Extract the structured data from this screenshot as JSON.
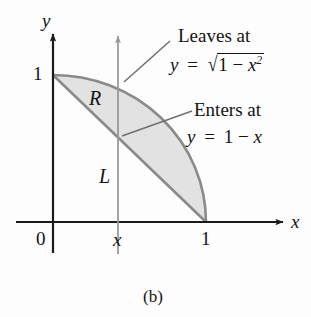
{
  "figure": {
    "caption": "(b)",
    "type": "math-diagram",
    "background_color": "#fdfdfd",
    "shade_color": "#e2e2e2",
    "curve_color": "#8a8a8a",
    "axis_color": "#1a1a1a",
    "helper_line_color": "#9a9a9a"
  },
  "axes": {
    "x_label": "x",
    "y_label": "y",
    "origin_label": "0",
    "x_ticks": [
      {
        "label": "x",
        "value": 0.42
      },
      {
        "label": "1",
        "value": 1
      }
    ],
    "y_ticks": [
      {
        "label": "1",
        "value": 1
      }
    ]
  },
  "region": {
    "label": "R",
    "description": "region between line y = 1 - x and quarter circle y = sqrt(1 - x^2)"
  },
  "vertical_line": {
    "label": "L",
    "x_value": 0.42
  },
  "callouts": [
    {
      "name": "leaves",
      "title": "Leaves at",
      "equation_lhs": "y",
      "equation_eq": "=",
      "equation_radical_symbol": "√",
      "equation_radicand_pre": "1 − ",
      "equation_radicand_var": "x",
      "equation_radicand_sup": "2",
      "equation_plain": "y = √(1 − x²)"
    },
    {
      "name": "enters",
      "title": "Enters at",
      "equation_lhs": "y",
      "equation_eq": "=",
      "equation_rhs": "1 − x",
      "equation_plain": "y = 1 − x"
    }
  ],
  "chart_data": {
    "type": "area",
    "title": "",
    "xlabel": "x",
    "ylabel": "y",
    "xlim": [
      0,
      1.55
    ],
    "ylim": [
      0,
      1.3
    ],
    "grid": false,
    "legend": "none",
    "annotations": [
      "Leaves at y = √(1 − x²)",
      "Enters at y = 1 − x",
      "R",
      "L"
    ],
    "series": [
      {
        "name": "upper boundary (quarter circle)",
        "equation": "y = sqrt(1 - x^2)",
        "x": [
          0,
          0.1,
          0.2,
          0.3,
          0.4,
          0.5,
          0.6,
          0.7,
          0.8,
          0.9,
          1.0
        ],
        "values": [
          1.0,
          0.995,
          0.98,
          0.954,
          0.917,
          0.866,
          0.8,
          0.714,
          0.6,
          0.436,
          0.0
        ]
      },
      {
        "name": "lower boundary (line)",
        "equation": "y = 1 - x",
        "x": [
          0,
          0.1,
          0.2,
          0.3,
          0.4,
          0.5,
          0.6,
          0.7,
          0.8,
          0.9,
          1.0
        ],
        "values": [
          1.0,
          0.9,
          0.8,
          0.7,
          0.6,
          0.5,
          0.4,
          0.3,
          0.2,
          0.1,
          0.0
        ]
      }
    ]
  }
}
